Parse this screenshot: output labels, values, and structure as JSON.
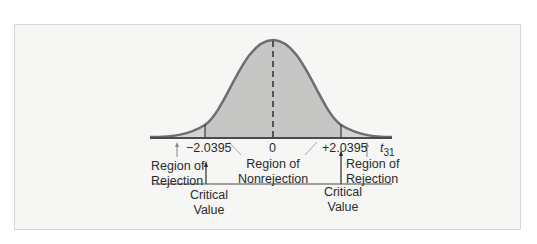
{
  "diagram": {
    "type": "t-distribution-two-tailed-test",
    "distribution_label": "t",
    "distribution_df": "31",
    "axis_ticks": {
      "left_critical": "−2.0395",
      "center": "0",
      "right_critical": "+2.0395"
    },
    "regions": {
      "left_rejection": [
        "Region of",
        "Rejection"
      ],
      "nonrejection": [
        "Region of",
        "Nonrejection"
      ],
      "right_rejection": [
        "Region of",
        "Rejection"
      ]
    },
    "critical_labels": {
      "left": [
        "Critical",
        "Value"
      ],
      "right": [
        "Critical",
        "Value"
      ]
    },
    "colors": {
      "frame_bg": "#f6f6f5",
      "curve_stroke": "#6e6e6e",
      "nonrejection_fill": "#c9c9c7",
      "rejection_fill": "#d3d3d1",
      "axis": "#4a4a4a",
      "text": "#2b2b2b"
    }
  }
}
